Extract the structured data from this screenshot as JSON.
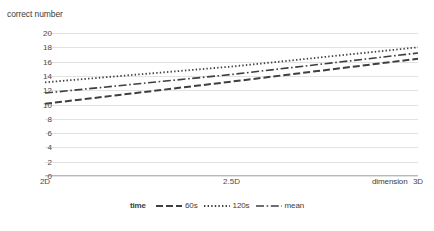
{
  "chart_data": {
    "type": "line",
    "title": "",
    "ylabel": "correct number",
    "xlabel": "dimension",
    "categories": [
      "2D",
      "2.5D",
      "3D"
    ],
    "x": [
      2,
      2.5,
      3
    ],
    "ylim": [
      0,
      20
    ],
    "xlim": [
      2,
      3
    ],
    "y_ticks": [
      0,
      2,
      4,
      6,
      8,
      10,
      12,
      14,
      16,
      18,
      20
    ],
    "grid": true,
    "legend_position": "bottom",
    "legend_title": "time",
    "series": [
      {
        "name": "60s",
        "dash": "dashed",
        "color": "#3f3f3f",
        "values": [
          10.1,
          13.2,
          16.4
        ]
      },
      {
        "name": "120s",
        "dash": "dotted",
        "color": "#3f3f3f",
        "values": [
          13.1,
          15.3,
          18.0
        ]
      },
      {
        "name": "mean",
        "dash": "dashdot",
        "color": "#3f3f3f",
        "values": [
          11.6,
          14.2,
          17.2
        ]
      }
    ]
  },
  "axes": {
    "y_title": "correct number",
    "x_title": "dimension",
    "y_tick_labels": [
      "20",
      "18",
      "16",
      "14",
      "12",
      "10",
      "8",
      "6",
      "4",
      "2",
      "0"
    ],
    "x_tick_labels": [
      "2D",
      "2.5D",
      "3D"
    ]
  },
  "legend": {
    "title": "time",
    "entries": [
      {
        "label": "60s",
        "style": "dashed"
      },
      {
        "label": "120s",
        "style": "dotted"
      },
      {
        "label": "mean",
        "style": "dashdot"
      }
    ]
  }
}
